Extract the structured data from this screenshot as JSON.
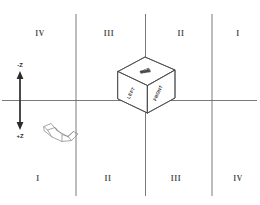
{
  "diagram": {
    "axis": {
      "vertical_arrow": {
        "top_label": "-Z",
        "bottom_label": "+Z"
      }
    },
    "quadrants": {
      "top_row": [
        {
          "label": "IV",
          "x": 40,
          "y": 33
        },
        {
          "label": "III",
          "x": 109,
          "y": 33
        },
        {
          "label": "II",
          "x": 181,
          "y": 33
        },
        {
          "label": "I",
          "x": 238,
          "y": 33
        }
      ],
      "bottom_row": [
        {
          "label": "I",
          "x": 38,
          "y": 178
        },
        {
          "label": "II",
          "x": 108,
          "y": 178
        },
        {
          "label": "III",
          "x": 176,
          "y": 178
        },
        {
          "label": "IV",
          "x": 238,
          "y": 178
        }
      ]
    },
    "cube": {
      "faces": {
        "top": "TOP",
        "left": "LEFT",
        "front": "FRONT"
      }
    },
    "objects": [
      {
        "name": "l-shaped-wireframe",
        "label": ""
      }
    ],
    "colors": {
      "grid_line": "#6b6b6b",
      "axis_arrow": "#2b2b2b",
      "cube_stroke": "#4a4a4a",
      "object_stroke": "#8a8a8a",
      "label_text": "#555555",
      "background": "#ffffff"
    }
  }
}
